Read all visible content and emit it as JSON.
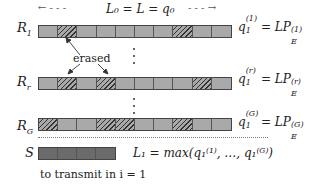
{
  "header": {
    "length_label": "L₀ = L = q₀",
    "left_arrow": "← - - -",
    "right_arrow": "- - - →"
  },
  "rows": [
    {
      "name": "R1",
      "label": "R",
      "label_sub": "1",
      "cells": 10,
      "erased_indices": [
        1,
        7
      ],
      "equation_lhs": "q",
      "equation_lhs_sub": "1",
      "equation_lhs_sup": "(1)",
      "equation_rhs": "= LP",
      "equation_rhs_sub": "E",
      "equation_rhs_sup": "(1)"
    },
    {
      "name": "Rr",
      "label": "R",
      "label_sub": "r",
      "cells": 10,
      "erased_indices": [
        1,
        3,
        8
      ],
      "equation_lhs": "q",
      "equation_lhs_sub": "1",
      "equation_lhs_sup": "(r)",
      "equation_rhs": "= LP",
      "equation_rhs_sub": "E",
      "equation_rhs_sup": "(r)"
    },
    {
      "name": "RG",
      "label": "R",
      "label_sub": "G",
      "cells": 10,
      "erased_indices": [
        0,
        3,
        4,
        7
      ],
      "equation_lhs": "q",
      "equation_lhs_sub": "1",
      "equation_lhs_sup": "(G)",
      "equation_rhs": "= LP",
      "equation_rhs_sub": "E",
      "equation_rhs_sup": "(G)"
    }
  ],
  "annotation": {
    "erased_label": "erased"
  },
  "source": {
    "label": "S",
    "cells": 4,
    "equation": "L₁ = max(q₁⁽¹⁾, …, q₁⁽ᴳ⁾)",
    "caption": "to transmit in i = 1"
  },
  "colors": {
    "cell_fill": "#a9a9a9",
    "source_fill": "#6b6b6b",
    "hatch": "#333333"
  }
}
